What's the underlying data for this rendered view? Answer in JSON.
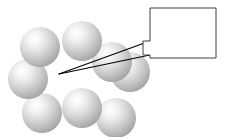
{
  "figure": {
    "width": 228,
    "height": 137,
    "background_color": "#ffffff"
  },
  "spheres": {
    "count": 8,
    "fill_highlight_color": "#ffffff",
    "fill_mid_color": "#dcdcdc",
    "fill_edge_color": "#a8a8a8",
    "items": [
      {
        "label": "sphere-top-left",
        "cx": 40,
        "cy": 47,
        "r": 20
      },
      {
        "label": "sphere-top-center",
        "cx": 82,
        "cy": 41,
        "r": 20
      },
      {
        "label": "sphere-middle-right",
        "cx": 112,
        "cy": 62,
        "r": 20
      },
      {
        "label": "sphere-middle-left",
        "cx": 28,
        "cy": 79,
        "r": 20
      },
      {
        "label": "sphere-bottom-left",
        "cx": 42,
        "cy": 113,
        "r": 20
      },
      {
        "label": "sphere-bottom-center",
        "cx": 82,
        "cy": 108,
        "r": 20
      },
      {
        "label": "sphere-bottom-right",
        "cx": 116,
        "cy": 118,
        "r": 20
      },
      {
        "label": "sphere-far-right-edge",
        "cx": 130,
        "cy": 72,
        "r": 20
      }
    ]
  },
  "callout": {
    "box_label": "callout-box",
    "text": "",
    "x": 150,
    "y": 8,
    "width": 66,
    "height": 50,
    "border_color": "#3f3f3f",
    "border_width": 1,
    "fill_color": "#ffffff"
  },
  "leader": {
    "label": "leader-lines",
    "color": "#000000",
    "width": 1,
    "tip_x": 59,
    "tip_y": 74,
    "upper_anchor_x": 150,
    "upper_anchor_y": 41,
    "lower_anchor_x": 150,
    "lower_anchor_y": 55,
    "notch_out_x": 143,
    "notch_top_y": 41,
    "notch_bottom_y": 55
  }
}
